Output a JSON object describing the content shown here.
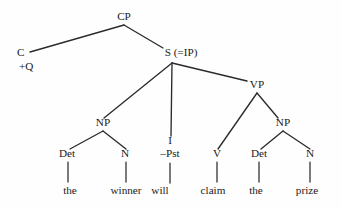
{
  "figure": {
    "kind": "syntax-tree",
    "background_color": "#fefefe",
    "ink_color": "#1a1a1a",
    "line_color": "#2b2b2b"
  },
  "sentence": {
    "words": [
      "the",
      "winner",
      "will",
      "claim",
      "the",
      "prize"
    ],
    "text": "the winner will claim the prize"
  },
  "nodes": {
    "cp": {
      "label": "CP",
      "x": 124,
      "y": 20
    },
    "c": {
      "label": "C",
      "x": 17,
      "y": 56
    },
    "c_feature": {
      "label": "+Q",
      "x": 19,
      "y": 70
    },
    "s": {
      "label": "S (=IP)",
      "x": 181,
      "y": 56
    },
    "np_subject": {
      "label": "NP",
      "x": 103,
      "y": 126
    },
    "i": {
      "label": "I",
      "x": 170,
      "y": 144
    },
    "i_feature": {
      "label": "–Pst",
      "x": 170,
      "y": 157
    },
    "vp": {
      "label": "VP",
      "x": 257,
      "y": 88
    },
    "v": {
      "label": "V",
      "x": 217,
      "y": 157
    },
    "np_object": {
      "label": "NP",
      "x": 283,
      "y": 126
    },
    "det_subject": {
      "label": "Det",
      "x": 67,
      "y": 157
    },
    "n_subject": {
      "label": "N",
      "x": 125,
      "y": 157
    },
    "det_object": {
      "label": "Det",
      "x": 259,
      "y": 157
    },
    "n_object": {
      "label": "N",
      "x": 310,
      "y": 157
    }
  },
  "terminals": {
    "the_subject": {
      "label": "the",
      "x": 70,
      "y": 194
    },
    "winner": {
      "label": "winner",
      "x": 126,
      "y": 194
    },
    "will": {
      "label": "will",
      "x": 160,
      "y": 194
    },
    "claim": {
      "label": "claim",
      "x": 213,
      "y": 194
    },
    "the_object": {
      "label": "the",
      "x": 256,
      "y": 194
    },
    "prize": {
      "label": "prize",
      "x": 307,
      "y": 194
    }
  },
  "edges": [
    {
      "name": "cp-to-c",
      "x1": 124,
      "y1": 25,
      "x2": 30,
      "y2": 52
    },
    {
      "name": "cp-to-s",
      "x1": 124,
      "y1": 25,
      "x2": 163,
      "y2": 48
    },
    {
      "name": "s-to-np-subject",
      "x1": 172,
      "y1": 63,
      "x2": 104,
      "y2": 118
    },
    {
      "name": "s-to-i",
      "x1": 172,
      "y1": 63,
      "x2": 171,
      "y2": 136
    },
    {
      "name": "s-to-vp",
      "x1": 172,
      "y1": 63,
      "x2": 247,
      "y2": 81
    },
    {
      "name": "vp-to-v",
      "x1": 257,
      "y1": 93,
      "x2": 218,
      "y2": 149
    },
    {
      "name": "vp-to-np-object",
      "x1": 257,
      "y1": 93,
      "x2": 278,
      "y2": 118
    },
    {
      "name": "np-subject-to-det",
      "x1": 103,
      "y1": 131,
      "x2": 70,
      "y2": 149
    },
    {
      "name": "np-subject-to-n",
      "x1": 103,
      "y1": 131,
      "x2": 126,
      "y2": 149
    },
    {
      "name": "np-object-to-det",
      "x1": 283,
      "y1": 131,
      "x2": 261,
      "y2": 149
    },
    {
      "name": "np-object-to-n",
      "x1": 283,
      "y1": 131,
      "x2": 310,
      "y2": 149
    }
  ],
  "stems": [
    {
      "name": "stem-det-subject-the",
      "x1": 68,
      "y1": 162,
      "x2": 68,
      "y2": 182
    },
    {
      "name": "stem-n-subject-winner",
      "x1": 126,
      "y1": 162,
      "x2": 126,
      "y2": 182
    },
    {
      "name": "stem-i-will",
      "x1": 170,
      "y1": 163,
      "x2": 170,
      "y2": 183
    },
    {
      "name": "stem-v-claim",
      "x1": 217,
      "y1": 162,
      "x2": 217,
      "y2": 182
    },
    {
      "name": "stem-det-object-the",
      "x1": 259,
      "y1": 162,
      "x2": 259,
      "y2": 182
    },
    {
      "name": "stem-n-object-prize",
      "x1": 310,
      "y1": 162,
      "x2": 310,
      "y2": 182
    }
  ]
}
